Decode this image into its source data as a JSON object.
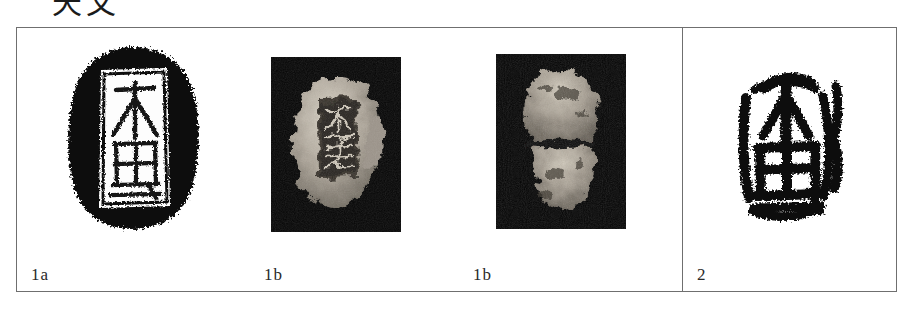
{
  "page": {
    "heading_partial": "天文",
    "background_color": "#ffffff",
    "border_color": "#6f6f6f",
    "ink_color": "#111111"
  },
  "figure": {
    "name": "seal-comparison-figure",
    "panels": [
      {
        "id": "panel-1a",
        "label": "1a",
        "content_type": "seal-rubbing-negative",
        "description": "Ink rubbing of seal: white seal-script characters reserved against a dense black irregular ground"
      },
      {
        "id": "panel-1b-obverse",
        "label": "1b",
        "content_type": "artifact-photograph",
        "description": "Photograph of the seal artifact obverse on black background showing incised characters"
      },
      {
        "id": "panel-1b-reverse",
        "label": "1b",
        "content_type": "artifact-photograph",
        "description": "Photograph of the seal artifact reverse on black background, rough eroded surface"
      },
      {
        "id": "panel-2",
        "label": "2",
        "content_type": "seal-impression-positive",
        "description": "Black ink seal impression of comparable characters on white ground"
      }
    ]
  }
}
